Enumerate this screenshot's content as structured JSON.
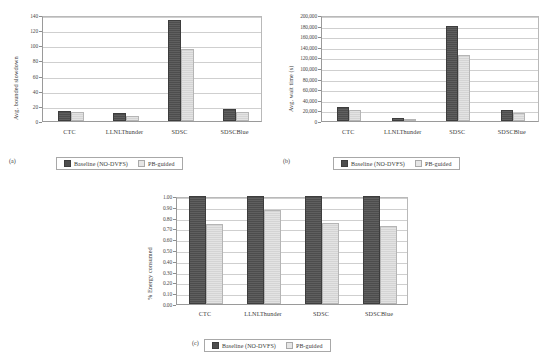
{
  "figure": {
    "panels": [
      {
        "id": "a",
        "caption": "(a)",
        "chart_data": {
          "type": "bar",
          "title": "",
          "xlabel": "",
          "ylabel": "Avg. bounded slowdown",
          "categories": [
            "CTC",
            "LLNLThunder",
            "SDSC",
            "SDSCBlue"
          ],
          "series": [
            {
              "name": "Baseline (NO-DVFS)",
              "values": [
                13,
                10,
                133,
                16
              ]
            },
            {
              "name": "PB-guided",
              "values": [
                12,
                6,
                95,
                12
              ]
            }
          ],
          "ylim": [
            0,
            140
          ],
          "yticks": [
            0,
            20,
            40,
            60,
            80,
            100,
            120,
            140
          ],
          "ytick_labels": [
            "0",
            "20",
            "40",
            "60",
            "80",
            "100",
            "120",
            "140"
          ],
          "grid": true,
          "legend_position": "bottom"
        }
      },
      {
        "id": "b",
        "caption": "(b)",
        "chart_data": {
          "type": "bar",
          "title": "",
          "xlabel": "",
          "ylabel": "Avg. wait time (s)",
          "categories": [
            "CTC",
            "LLNLThunder",
            "SDSC",
            "SDSCBlue"
          ],
          "series": [
            {
              "name": "Baseline (NO-DVFS)",
              "values": [
                27000,
                5000,
                180000,
                21000
              ]
            },
            {
              "name": "PB-guided",
              "values": [
                21000,
                2000,
                125000,
                15000
              ]
            }
          ],
          "ylim": [
            0,
            200000
          ],
          "yticks": [
            0,
            20000,
            40000,
            60000,
            80000,
            100000,
            120000,
            140000,
            160000,
            180000,
            200000
          ],
          "ytick_labels": [
            "0",
            "20,000",
            "40,000",
            "60,000",
            "80,000",
            "100,000",
            "120,000",
            "140,000",
            "160,000",
            "180,000",
            "200,000"
          ],
          "grid": true,
          "legend_position": "bottom"
        }
      },
      {
        "id": "c",
        "caption": "(c)",
        "chart_data": {
          "type": "bar",
          "title": "",
          "xlabel": "",
          "ylabel": "% Energy consumed",
          "categories": [
            "CTC",
            "LLNLThunder",
            "SDSC",
            "SDSCBlue"
          ],
          "series": [
            {
              "name": "Baseline (NO-DVFS)",
              "values": [
                1.0,
                1.0,
                1.0,
                1.0
              ]
            },
            {
              "name": "PB-guided",
              "values": [
                0.74,
                0.87,
                0.75,
                0.72
              ]
            }
          ],
          "ylim": [
            0,
            1.0
          ],
          "yticks": [
            0.0,
            0.1,
            0.2,
            0.3,
            0.4,
            0.5,
            0.6,
            0.7,
            0.8,
            0.9,
            1.0
          ],
          "ytick_labels": [
            "0.00",
            "0.10",
            "0.20",
            "0.30",
            "0.40",
            "0.50",
            "0.60",
            "0.70",
            "0.80",
            "0.90",
            "1.00"
          ],
          "grid": true,
          "legend_position": "bottom"
        }
      }
    ]
  },
  "colors": {
    "series0": "#4d4d4d",
    "series1": "#d4d4d4",
    "grid": "#cfcfcf",
    "axis": "#9a9a9a",
    "background": "#ffffff"
  }
}
